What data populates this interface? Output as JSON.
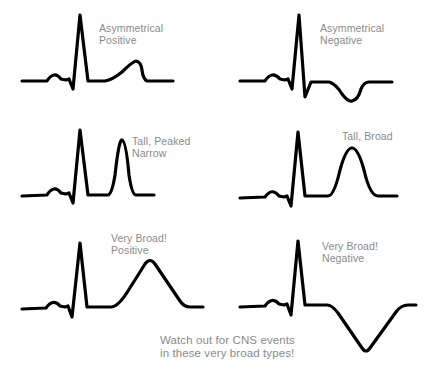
{
  "diagram": {
    "panels": [
      {
        "id": "asym-pos",
        "label_line1": "Asymmetrical",
        "label_line2": "Positive",
        "t_wave": "asymmetrical positive"
      },
      {
        "id": "asym-neg",
        "label_line1": "Asymmetrical",
        "label_line2": "Negative",
        "t_wave": "asymmetrical negative"
      },
      {
        "id": "tall-peaked",
        "label_line1": "Tall, Peaked",
        "label_line2": "Narrow",
        "t_wave": "tall peaked narrow"
      },
      {
        "id": "tall-broad",
        "label_line1": "Tall, Broad",
        "label_line2": "",
        "t_wave": "tall broad"
      },
      {
        "id": "vbroad-pos",
        "label_line1": "Very Broad!",
        "label_line2": "Positive",
        "t_wave": "very broad positive"
      },
      {
        "id": "vbroad-neg",
        "label_line1": "Very Broad!",
        "label_line2": "Negative",
        "t_wave": "very broad negative"
      }
    ],
    "note_line1": "Watch out for CNS events",
    "note_line2": "in these very broad types!",
    "colors": {
      "trace": "#000000",
      "text": "#8a8a8a",
      "background": "#ffffff"
    }
  }
}
